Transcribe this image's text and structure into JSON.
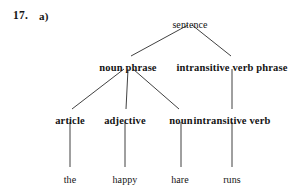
{
  "exercise": {
    "number": "17.",
    "part": "a)"
  },
  "diagram": {
    "type": "parse-tree",
    "line_color": "#2b2b2b",
    "background": "#ffffff",
    "nodes": [
      {
        "id": "sentence",
        "label": "sentence",
        "level": 0,
        "style": "plain",
        "x": 190,
        "y": 20
      },
      {
        "id": "np",
        "label": "noun phrase",
        "level": 1,
        "style": "bold",
        "x": 128,
        "y": 63
      },
      {
        "id": "ivp",
        "label": "intransitive verb phrase",
        "level": 1,
        "style": "bold",
        "x": 232,
        "y": 63
      },
      {
        "id": "article",
        "label": "article",
        "level": 2,
        "style": "bold",
        "x": 70,
        "y": 116
      },
      {
        "id": "adjective",
        "label": "adjective",
        "level": 2,
        "style": "bold",
        "x": 125,
        "y": 116
      },
      {
        "id": "noun",
        "label": "noun",
        "level": 2,
        "style": "bold",
        "x": 181,
        "y": 116
      },
      {
        "id": "iv",
        "label": "intransitive verb",
        "level": 2,
        "style": "bold",
        "x": 232,
        "y": 116
      },
      {
        "id": "the",
        "label": "the",
        "level": 3,
        "style": "plain",
        "x": 70,
        "y": 175
      },
      {
        "id": "happy",
        "label": "happy",
        "level": 3,
        "style": "plain",
        "x": 125,
        "y": 175
      },
      {
        "id": "hare",
        "label": "hare",
        "level": 3,
        "style": "plain",
        "x": 180,
        "y": 175
      },
      {
        "id": "runs",
        "label": "runs",
        "level": 3,
        "style": "plain",
        "x": 232,
        "y": 175
      }
    ],
    "edges": [
      {
        "from": "sentence",
        "to": "np",
        "x1": 188,
        "y1": 25,
        "x2": 131,
        "y2": 56
      },
      {
        "from": "sentence",
        "to": "ivp",
        "x1": 192,
        "y1": 25,
        "x2": 231,
        "y2": 56
      },
      {
        "from": "np",
        "to": "article",
        "x1": 124,
        "y1": 69,
        "x2": 72,
        "y2": 109
      },
      {
        "from": "np",
        "to": "adjective",
        "x1": 128,
        "y1": 69,
        "x2": 126,
        "y2": 109
      },
      {
        "from": "np",
        "to": "noun",
        "x1": 133,
        "y1": 69,
        "x2": 179,
        "y2": 109
      },
      {
        "from": "ivp",
        "to": "iv",
        "x1": 232,
        "y1": 69,
        "x2": 232,
        "y2": 109
      },
      {
        "from": "article",
        "to": "the",
        "x1": 70,
        "y1": 122,
        "x2": 70,
        "y2": 167
      },
      {
        "from": "adjective",
        "to": "happy",
        "x1": 125,
        "y1": 122,
        "x2": 125,
        "y2": 167
      },
      {
        "from": "noun",
        "to": "hare",
        "x1": 181,
        "y1": 122,
        "x2": 181,
        "y2": 167
      },
      {
        "from": "iv",
        "to": "runs",
        "x1": 232,
        "y1": 122,
        "x2": 232,
        "y2": 167
      }
    ]
  }
}
